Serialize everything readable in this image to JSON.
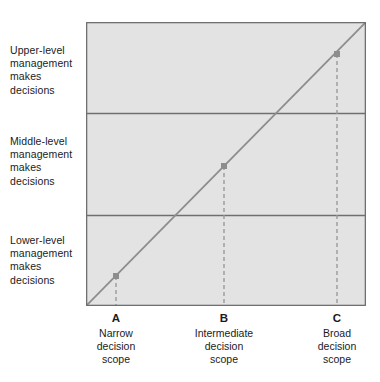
{
  "figure": {
    "plot": {
      "fill_color": "#e3e3e3",
      "border_color": "#6f6f6f",
      "divider_color": "#6f6f6f",
      "line_color": "#8d8d8d",
      "dash_color": "#9a9a9a",
      "marker_color": "#8d8d8d"
    }
  },
  "y_bands": [
    {
      "id": "upper",
      "label": "Upper-level\nmanagement\nmakes\ndecisions"
    },
    {
      "id": "middle",
      "label": "Middle-level\nmanagement\nmakes\ndecisions"
    },
    {
      "id": "lower",
      "label": "Lower-level\nmanagement\nmakes\ndecisions"
    }
  ],
  "x_ticks": [
    {
      "id": "a",
      "letter": "A",
      "caption": "Narrow\ndecision\nscope"
    },
    {
      "id": "b",
      "letter": "B",
      "caption": "Intermediate\ndecision\nscope"
    },
    {
      "id": "c",
      "letter": "C",
      "caption": "Broad\ndecision\nscope"
    }
  ],
  "chart_data": {
    "type": "line",
    "title": "",
    "xlabel": "Decision scope",
    "ylabel": "Level of management making decisions",
    "grid": false,
    "legend": "none",
    "xlim": [
      0,
      1
    ],
    "ylim": [
      0,
      1
    ],
    "x_tick_labels": [
      "Narrow decision scope",
      "Intermediate decision scope",
      "Broad decision scope"
    ],
    "x_tick_letters": [
      "A",
      "B",
      "C"
    ],
    "x_tick_values": [
      0.107,
      0.493,
      0.896
    ],
    "y_tick_labels": [
      "Lower-level management makes decisions",
      "Middle-level management makes decisions",
      "Upper-level management makes decisions"
    ],
    "y_band_boundaries": [
      0.32,
      0.68
    ],
    "series": [
      {
        "name": "decision scope trend",
        "type": "line",
        "x": [
          0,
          1
        ],
        "y": [
          0,
          1
        ],
        "style": "solid"
      }
    ],
    "annotated_points": [
      {
        "label": "A",
        "x": 0.107,
        "y": 0.107,
        "band": "Lower-level management makes decisions"
      },
      {
        "label": "B",
        "x": 0.493,
        "y": 0.493,
        "band": "Middle-level management makes decisions"
      },
      {
        "label": "C",
        "x": 0.896,
        "y": 0.896,
        "band": "Upper-level management makes decisions"
      }
    ]
  }
}
